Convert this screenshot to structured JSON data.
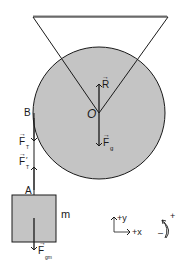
{
  "diagram": {
    "type": "physics-free-body",
    "colors": {
      "fill": "#c4c4c4",
      "stroke": "#1a1a1a",
      "background": "#ffffff"
    },
    "labels": {
      "ceiling": "",
      "pivot_center": "O",
      "point_b": "B",
      "point_a": "A",
      "mass": "m"
    },
    "forces": {
      "normal": {
        "symbol": "R",
        "arrow": "→",
        "sub": ""
      },
      "gravity_pulley": {
        "symbol": "F",
        "arrow": "→",
        "sub": "g"
      },
      "tension_b": {
        "symbol": "F",
        "arrow": "→",
        "sub": "T"
      },
      "tension_a": {
        "symbol": "F",
        "arrow": "→",
        "sub": "T",
        "prime": "′"
      },
      "gravity_mass": {
        "symbol": "F",
        "arrow": "→",
        "sub": "gm"
      }
    },
    "axes": {
      "y_label": "+y",
      "x_label": "+x"
    },
    "rotation": {
      "plus": "+",
      "minus": "–"
    }
  }
}
